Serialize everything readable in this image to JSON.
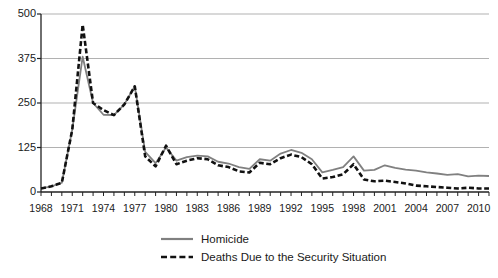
{
  "chart_data": {
    "type": "line",
    "title": "",
    "subtitle": "",
    "xlabel": "",
    "ylabel": "",
    "xlim": [
      1968,
      2011
    ],
    "ylim": [
      0,
      500
    ],
    "yticks": [
      0,
      125,
      250,
      375,
      500
    ],
    "grid": "horizontal",
    "legend_position": "bottom-center",
    "x": [
      1968,
      1969,
      1970,
      1971,
      1972,
      1973,
      1974,
      1975,
      1976,
      1977,
      1978,
      1979,
      1980,
      1981,
      1982,
      1983,
      1984,
      1985,
      1986,
      1987,
      1988,
      1989,
      1990,
      1991,
      1992,
      1993,
      1994,
      1995,
      1996,
      1997,
      1998,
      1999,
      2000,
      2001,
      2002,
      2003,
      2004,
      2005,
      2006,
      2007,
      2008,
      2009,
      2010,
      2011
    ],
    "xtick_labels": [
      "1968",
      "1971",
      "1974",
      "1977",
      "1980",
      "1983",
      "1986",
      "1989",
      "1992",
      "1995",
      "1998",
      "2001",
      "2004",
      "2007",
      "2010"
    ],
    "xtick_values": [
      1968,
      1971,
      1974,
      1977,
      1980,
      1983,
      1986,
      1989,
      1992,
      1995,
      1998,
      2001,
      2004,
      2007,
      2010
    ],
    "series": [
      {
        "name": "Homicide",
        "style": "solid",
        "color": "#808080",
        "values": [
          10,
          16,
          26,
          175,
          380,
          250,
          217,
          216,
          246,
          297,
          113,
          81,
          125,
          88,
          98,
          102,
          100,
          85,
          80,
          70,
          65,
          92,
          88,
          108,
          118,
          110,
          92,
          55,
          62,
          70,
          100,
          60,
          62,
          75,
          68,
          63,
          60,
          55,
          52,
          48,
          50,
          44,
          46,
          45
        ]
      },
      {
        "name": "Deaths Due to the Security Situation",
        "style": "dashed",
        "color": "#111111",
        "values": [
          10,
          16,
          26,
          175,
          470,
          250,
          230,
          216,
          246,
          297,
          100,
          72,
          130,
          78,
          88,
          95,
          92,
          75,
          70,
          58,
          55,
          82,
          78,
          95,
          105,
          98,
          78,
          38,
          42,
          50,
          78,
          35,
          30,
          32,
          28,
          24,
          18,
          16,
          14,
          12,
          10,
          12,
          10,
          10
        ]
      }
    ]
  },
  "legend": {
    "items": [
      {
        "label": "Homicide",
        "swatch": "solid-line-swatch"
      },
      {
        "label": "Deaths Due to the Security Situation",
        "swatch": "dashed-line-swatch"
      }
    ]
  },
  "caption": {
    "text": ""
  }
}
